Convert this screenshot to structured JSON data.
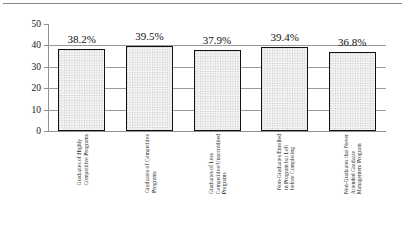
{
  "chart_data": {
    "type": "bar",
    "title": "",
    "subtitle": "",
    "xlabel": "",
    "ylabel": "",
    "ylim": [
      0,
      50
    ],
    "ytick_labels": [
      "50",
      "40",
      "30",
      "20",
      "10",
      "0"
    ],
    "ytick_values": [
      50,
      40,
      30,
      20,
      10,
      0
    ],
    "grid": true,
    "legend": false,
    "legend_position": "none",
    "categories": [
      "Graduates of Highly Competitive Programs",
      "Graduates of Competitive Programs",
      "Graduates of Less Competitive/Unaccredited Programs",
      "Non-Graduates Enrolled in Program but Left before Completing",
      "Non-Graduates that Never Attended Graduate Management Program"
    ],
    "category_lines": [
      [
        "Graduates of Highly",
        "Competitive Programs"
      ],
      [
        "Graduates of Competitive",
        "Programs"
      ],
      [
        "Graduates of Less",
        "Competitive/Unaccredited",
        "Programs"
      ],
      [
        "Non-Graduates Enrolled",
        "in Program but Left",
        "before Completing"
      ],
      [
        "Non-Graduates that Never",
        "Attended Graduate",
        "Management Program"
      ]
    ],
    "values": [
      38.2,
      39.5,
      37.9,
      39.4,
      36.8
    ],
    "data_labels": [
      "38.2%",
      "39.5%",
      "37.9%",
      "39.4%",
      "36.8%"
    ],
    "colors": {
      "bar_fill": "#f1f1f1",
      "bar_pattern": "#b9b9b9",
      "bar_border": "#111111",
      "gridline": "#9a9a9a",
      "axis": "#8f8f8f",
      "text": "#111111",
      "background": "#ffffff"
    }
  }
}
